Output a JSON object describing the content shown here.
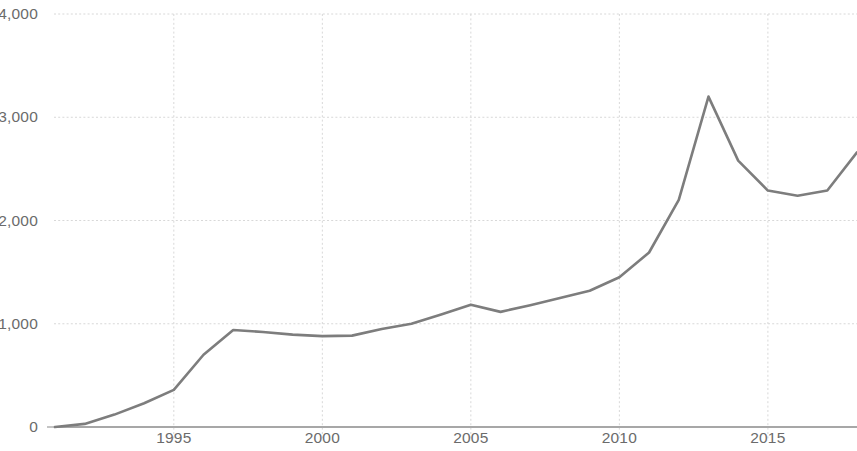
{
  "chart_data": {
    "type": "line",
    "title": "",
    "subtitle": "",
    "xlabel": "",
    "ylabel": "",
    "xlim": [
      1991,
      2018
    ],
    "ylim": [
      0,
      4000
    ],
    "grid": true,
    "legend": null,
    "y_ticks": [
      "0",
      "1,000",
      "2,000",
      "3,000",
      "4,000"
    ],
    "y_tick_values": [
      0,
      1000,
      2000,
      3000,
      4000
    ],
    "x_ticks": [
      "1995",
      "2000",
      "2005",
      "2010",
      "2015"
    ],
    "x_tick_values": [
      1995,
      2000,
      2005,
      2010,
      2015
    ],
    "line_color": "#7d7d7d",
    "grid_color": "#d8d8d8",
    "axis_color": "#8a8a8a",
    "series": [
      {
        "name": "",
        "x": [
          1991,
          1992,
          1993,
          1994,
          1995,
          1996,
          1997,
          1998,
          1999,
          2000,
          2001,
          2002,
          2003,
          2004,
          2005,
          2006,
          2007,
          2008,
          2009,
          2010,
          2011,
          2012,
          2013,
          2014,
          2015,
          2016,
          2017,
          2018
        ],
        "values": [
          0,
          30,
          120,
          230,
          360,
          700,
          940,
          920,
          895,
          880,
          885,
          950,
          1000,
          1090,
          1185,
          1115,
          1180,
          1250,
          1320,
          1450,
          1690,
          2200,
          3200,
          2580,
          2290,
          2240,
          2290,
          2660
        ]
      }
    ]
  }
}
